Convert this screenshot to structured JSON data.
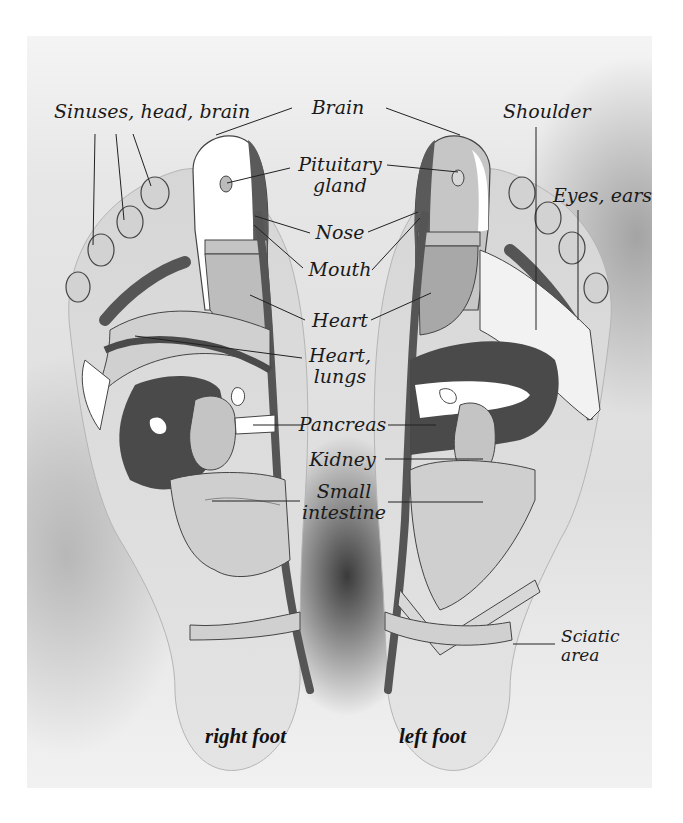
{
  "diagram": {
    "colors": {
      "background": "#ffffff",
      "photo_bg": "#e2e2e2",
      "zone_dark": "#4a4a4a",
      "zone_mid": "#9a9a9a",
      "zone_light": "#c8c8c8",
      "zone_white": "#ffffff",
      "outline": "#3a3a3a",
      "text": "#1a1a1a"
    },
    "labels": {
      "sinuses": "Sinuses, head, brain",
      "brain": "Brain",
      "shoulder": "Shoulder",
      "pituitary_line1": "Pituitary",
      "pituitary_line2": "gland",
      "eyes_ears": "Eyes, ears",
      "nose": "Nose",
      "mouth": "Mouth",
      "heart": "Heart",
      "heart_lungs_line1": "Heart,",
      "heart_lungs_line2": "lungs",
      "pancreas": "Pancreas",
      "kidney": "Kidney",
      "small_intestine_line1": "Small",
      "small_intestine_line2": "intestine",
      "sciatic_line1": "Sciatic",
      "sciatic_line2": "area"
    },
    "captions": {
      "right_foot": "right foot",
      "left_foot": "left foot"
    }
  }
}
